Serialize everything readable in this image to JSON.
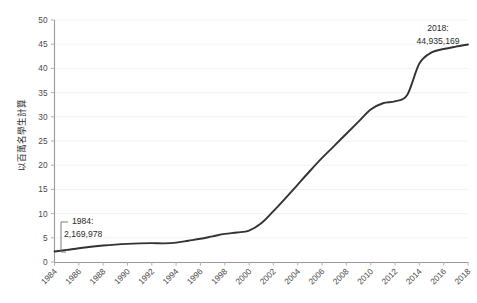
{
  "chart_data": {
    "type": "line",
    "title": "",
    "xlabel": "",
    "ylabel": "以百萬名學生計算",
    "ylim": [
      0,
      50
    ],
    "xlim": [
      1984,
      2018
    ],
    "grid": true,
    "legend": "none",
    "y_ticks": [
      "0",
      "5",
      "10",
      "15",
      "20",
      "25",
      "30",
      "35",
      "40",
      "45",
      "50"
    ],
    "x_ticks": [
      "1984",
      "1986",
      "1988",
      "1990",
      "1992",
      "1994",
      "1996",
      "1998",
      "2000",
      "2002",
      "2004",
      "2006",
      "2008",
      "2010",
      "2012",
      "2014",
      "2016",
      "2018"
    ],
    "x": [
      1984,
      1985,
      1986,
      1987,
      1988,
      1989,
      1990,
      1991,
      1992,
      1993,
      1994,
      1995,
      1996,
      1997,
      1998,
      1999,
      2000,
      2001,
      2002,
      2003,
      2004,
      2005,
      2006,
      2007,
      2008,
      2009,
      2010,
      2011,
      2012,
      2013,
      2014,
      2015,
      2016,
      2017,
      2018
    ],
    "values": [
      2.17,
      2.5,
      2.85,
      3.15,
      3.4,
      3.6,
      3.75,
      3.85,
      3.9,
      3.85,
      4.0,
      4.4,
      4.8,
      5.3,
      5.8,
      6.1,
      6.5,
      8.0,
      10.5,
      13.2,
      16.0,
      18.8,
      21.5,
      24.0,
      26.5,
      29.0,
      31.5,
      32.8,
      33.2,
      34.5,
      41.0,
      43.3,
      44.0,
      44.5,
      44.935
    ],
    "series": [
      {
        "name": "以百萬名學生計算",
        "color": "#333333",
        "values": [
          2.17,
          2.5,
          2.85,
          3.15,
          3.4,
          3.6,
          3.75,
          3.85,
          3.9,
          3.85,
          4.0,
          4.4,
          4.8,
          5.3,
          5.8,
          6.1,
          6.5,
          8.0,
          10.5,
          13.2,
          16.0,
          18.8,
          21.5,
          24.0,
          26.5,
          29.0,
          31.5,
          32.8,
          33.2,
          34.5,
          41.0,
          43.3,
          44.0,
          44.5,
          44.935
        ]
      }
    ],
    "annotations": [
      {
        "id": "start-point",
        "year_label": "1984:",
        "value_label": "2,169,978",
        "x": 1984,
        "y": 2.17
      },
      {
        "id": "end-point",
        "year_label": "2018:",
        "value_label": "44,935,169",
        "x": 2018,
        "y": 44.935
      }
    ],
    "colors": {
      "line": "#333333",
      "grid": "#f2f2f2",
      "axis": "#9a9a9a",
      "text": "#4a4a4a",
      "background": "#ffffff"
    }
  }
}
